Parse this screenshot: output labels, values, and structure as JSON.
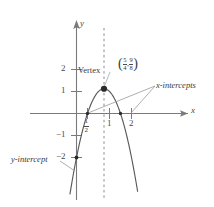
{
  "figure": {
    "axis_labels": {
      "x": "x",
      "y": "y"
    },
    "callouts": {
      "vertex": "Vertex",
      "x_intercepts": "x-intercepts",
      "y_intercept": "y-intercept"
    },
    "vertex_coordinate": {
      "open_paren": "(",
      "x_num": "5",
      "x_den": "4",
      "comma": ",",
      "y_num": "9",
      "y_den": "8",
      "close_paren": ")"
    },
    "ticks": {
      "y": [
        "2",
        "1",
        "−1",
        "−2"
      ],
      "x_one": "1",
      "x_two": "2",
      "x_half_num": "1",
      "x_half_den": "2"
    },
    "colors": {
      "curve": "#5a5a5a",
      "axis": "#7a7a7a",
      "dashed": "#8a8a8a",
      "leader": "#9a9a9a",
      "point": "#2b2b2b",
      "text": "#3a3a3a"
    }
  },
  "chart_data": {
    "type": "line",
    "title": "",
    "xlabel": "x",
    "ylabel": "y",
    "xlim": [
      -0.6,
      3.2
    ],
    "ylim": [
      -2.6,
      2.4
    ],
    "grid": false,
    "legend": null,
    "function": "y = -2x^2 + 5x - 2",
    "series": [
      {
        "name": "parabola",
        "x": [
          0.0,
          0.125,
          0.25,
          0.375,
          0.5,
          0.625,
          0.75,
          0.875,
          1.0,
          1.125,
          1.25,
          1.375,
          1.5,
          1.625,
          1.75,
          1.875,
          2.0,
          2.125,
          2.25,
          2.375,
          2.5
        ],
        "y": [
          -2.0,
          -1.406,
          -0.875,
          -0.406,
          0.0,
          0.344,
          0.625,
          0.844,
          1.0,
          1.094,
          1.125,
          1.094,
          1.0,
          0.844,
          0.625,
          0.344,
          0.0,
          -0.406,
          -0.875,
          -1.406,
          -2.0
        ]
      }
    ],
    "annotations": [
      {
        "label": "Vertex",
        "x": 1.25,
        "y": 1.125,
        "display": "(5/4, 9/8)"
      },
      {
        "label": "x-intercepts",
        "points": [
          {
            "x": 0.5,
            "y": 0
          },
          {
            "x": 2.0,
            "y": 0
          }
        ]
      },
      {
        "label": "y-intercept",
        "points": [
          {
            "x": 0,
            "y": -2
          }
        ]
      }
    ],
    "axis_of_symmetry": {
      "x": 1.25,
      "style": "dashed"
    },
    "xticks": [
      "1/2",
      "1",
      "2"
    ],
    "yticks": [
      "2",
      "1",
      "-1",
      "-2"
    ]
  }
}
